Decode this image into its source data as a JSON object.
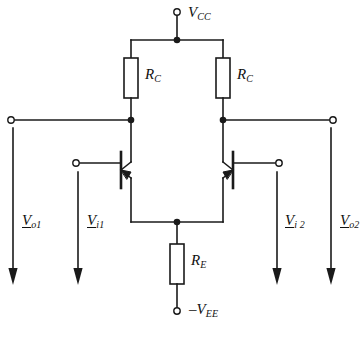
{
  "figure": {
    "type": "circuit-schematic",
    "line_color": "#1a1a1a",
    "background_color": "#ffffff"
  },
  "supplies": {
    "positive": {
      "symbol": "V",
      "subscript": "CC",
      "prefix": "",
      "label": "VCC"
    },
    "negative": {
      "symbol": "V",
      "subscript": "EE",
      "prefix": "–",
      "label": "-VEE"
    }
  },
  "components": {
    "resistor_left": {
      "symbol": "R",
      "subscript": "C",
      "label": "RC"
    },
    "resistor_right": {
      "symbol": "R",
      "subscript": "C",
      "label": "RC"
    },
    "resistor_emitter": {
      "symbol": "R",
      "subscript": "E",
      "label": "RE"
    },
    "transistor_left": {
      "type": "bjt",
      "name": "Q1"
    },
    "transistor_right": {
      "type": "bjt",
      "name": "Q2"
    }
  },
  "signals": [
    {
      "id": "vo1",
      "symbol": "V",
      "subscript": "o1",
      "underlined": true,
      "side": "left",
      "kind": "output"
    },
    {
      "id": "vi1",
      "symbol": "V",
      "subscript": "i1",
      "underlined": true,
      "side": "left",
      "kind": "input"
    },
    {
      "id": "vi2",
      "symbol": "V",
      "subscript": "i 2",
      "underlined": true,
      "side": "right",
      "kind": "input"
    },
    {
      "id": "vo2",
      "symbol": "V",
      "subscript": "o2",
      "underlined": true,
      "side": "right",
      "kind": "output"
    }
  ],
  "terminals": [
    {
      "id": "vcc-terminal",
      "label": "VCC"
    },
    {
      "id": "vee-terminal",
      "label": "-VEE"
    },
    {
      "id": "out1-terminal",
      "label": "Vo1"
    },
    {
      "id": "out2-terminal",
      "label": "Vo2"
    },
    {
      "id": "in1-terminal",
      "label": "Vi1"
    },
    {
      "id": "in2-terminal",
      "label": "Vi2"
    }
  ]
}
